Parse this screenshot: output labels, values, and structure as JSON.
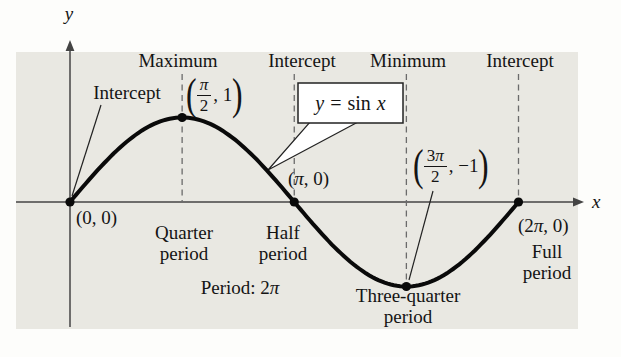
{
  "page": {
    "bg": "#fdfdfb",
    "panel_bg": "#e9e8e2",
    "ink": "#141414",
    "curve_color": "#0a0a0a",
    "axis_color": "#444444",
    "dash_color": "#6b6b6b"
  },
  "figure": {
    "y_axis_label": "y",
    "x_axis_label": "x",
    "equation": {
      "lhs": "y",
      "rel": "=",
      "fn": "sin",
      "var": "x"
    },
    "annotations": {
      "intercept_left": "Intercept",
      "maximum": "Maximum",
      "intercept_top": "Intercept",
      "minimum": "Minimum",
      "intercept_right": "Intercept"
    },
    "point_labels": {
      "origin": "(0, 0)",
      "pi": "(π, 0)",
      "two_pi": "(2π, 0)",
      "max": {
        "open": "(",
        "num": "π",
        "den": "2",
        "tail": ", 1",
        "close": ")"
      },
      "min": {
        "open": "(",
        "num": "3π",
        "den": "2",
        "tail": ", −1",
        "close": ")"
      }
    },
    "period_labels": {
      "quarter": {
        "line1": "Quarter",
        "line2": "period"
      },
      "half": {
        "line1": "Half",
        "line2": "period"
      },
      "three_quarter": {
        "line1": "Three-quarter",
        "line2": "period"
      },
      "full": {
        "line1": "Full",
        "line2": "period"
      },
      "period": "Period: 2π"
    }
  },
  "chart_data": {
    "type": "line",
    "title": "y = sin x",
    "series": [
      {
        "name": "y = sin x",
        "function": "sin(x)"
      }
    ],
    "x_range": [
      0,
      6.283185307179586
    ],
    "x_range_labels": [
      "0",
      "2π"
    ],
    "ylim": [
      -1,
      1
    ],
    "period": "2π",
    "grid": "dashed vertical guides at x = π/2, π, 3π/2, 2π",
    "legend_position": "callout box pointing at curve",
    "key_points": [
      {
        "x": 0,
        "y": 0,
        "x_label": "0",
        "label": "(0, 0)",
        "role": "Intercept",
        "period_fraction": ""
      },
      {
        "x": 1.570796,
        "y": 1,
        "x_label": "π/2",
        "label": "(π/2, 1)",
        "role": "Maximum",
        "period_fraction": "Quarter period"
      },
      {
        "x": 3.141593,
        "y": 0,
        "x_label": "π",
        "label": "(π, 0)",
        "role": "Intercept",
        "period_fraction": "Half period"
      },
      {
        "x": 4.712389,
        "y": -1,
        "x_label": "3π/2",
        "label": "(3π/2, −1)",
        "role": "Minimum",
        "period_fraction": "Three-quarter period"
      },
      {
        "x": 6.283185,
        "y": 0,
        "x_label": "2π",
        "label": "(2π, 0)",
        "role": "Intercept",
        "period_fraction": "Full period"
      }
    ]
  }
}
